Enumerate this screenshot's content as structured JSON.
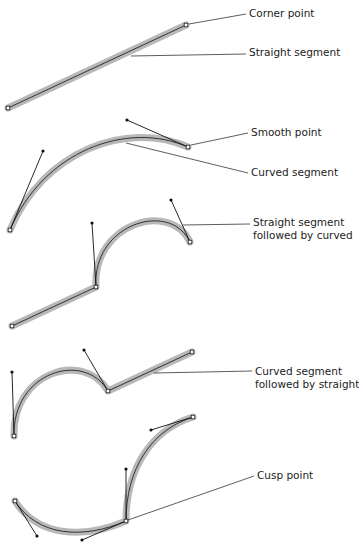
{
  "diagram": {
    "colors": {
      "halo": "#b8b8b8",
      "path": "#222222",
      "handle": "#111111",
      "leader": "#333333",
      "text": "#222222"
    },
    "labels": [
      {
        "id": "corner_point",
        "lines": [
          "Corner point"
        ],
        "x": 249,
        "y": 7
      },
      {
        "id": "straight_segment",
        "lines": [
          "Straight segment"
        ],
        "x": 249,
        "y": 46
      },
      {
        "id": "smooth_point",
        "lines": [
          "Smooth point"
        ],
        "x": 251,
        "y": 126
      },
      {
        "id": "curved_segment",
        "lines": [
          "Curved segment"
        ],
        "x": 251,
        "y": 166
      },
      {
        "id": "straight_then_curved",
        "lines": [
          "Straight segment",
          "followed by curved"
        ],
        "x": 253,
        "y": 216
      },
      {
        "id": "curved_then_straight",
        "lines": [
          "Curved segment",
          "followed by straight"
        ],
        "x": 255,
        "y": 365
      },
      {
        "id": "cusp_point",
        "lines": [
          "Cusp point"
        ],
        "x": 257,
        "y": 469
      }
    ],
    "shapes": [
      {
        "id": "straight_line",
        "path": "M8,108 L186,25",
        "anchors": [
          [
            8,
            108
          ],
          [
            186,
            25
          ]
        ],
        "handles": []
      },
      {
        "id": "smooth_curve",
        "path": "M10,230 C43,151 127,120 188,147",
        "anchors": [
          [
            10,
            230
          ],
          [
            188,
            147
          ]
        ],
        "handles": [
          [
            [
              10,
              230
            ],
            [
              43,
              151
            ]
          ],
          [
            [
              188,
              147
            ],
            [
              127,
              120
            ]
          ]
        ]
      },
      {
        "id": "straight_then_curve",
        "path": "M12,326 L96,287 C92,223 171,200 190,242",
        "anchors": [
          [
            12,
            326
          ],
          [
            96,
            287
          ],
          [
            190,
            242
          ]
        ],
        "handles": [
          [
            [
              96,
              287
            ],
            [
              92,
              223
            ]
          ],
          [
            [
              190,
              242
            ],
            [
              171,
              200
            ]
          ]
        ]
      },
      {
        "id": "curve_then_straight",
        "path": "M14,436 C12,372 84,350 108,391 L192,352",
        "anchors": [
          [
            14,
            436
          ],
          [
            108,
            391
          ],
          [
            192,
            352
          ]
        ],
        "handles": [
          [
            [
              14,
              436
            ],
            [
              12,
              372
            ]
          ],
          [
            [
              108,
              391
            ],
            [
              84,
              350
            ]
          ]
        ]
      },
      {
        "id": "cusp_shape",
        "path": "M15,501 C37,536 82,540 126,521 C126,469 151,430 193,417",
        "anchors": [
          [
            15,
            501
          ],
          [
            126,
            521
          ],
          [
            193,
            417
          ]
        ],
        "handles": [
          [
            [
              15,
              501
            ],
            [
              37,
              536
            ]
          ],
          [
            [
              126,
              521
            ],
            [
              82,
              540
            ]
          ],
          [
            [
              126,
              521
            ],
            [
              126,
              469
            ]
          ],
          [
            [
              193,
              417
            ],
            [
              151,
              430
            ]
          ]
        ]
      }
    ],
    "leaders": [
      {
        "for": "corner_point",
        "from": [
          189,
          24
        ],
        "to": [
          246,
          14
        ]
      },
      {
        "for": "straight_segment",
        "from": [
          131,
          56
        ],
        "to": [
          246,
          54
        ]
      },
      {
        "for": "smooth_point",
        "from": [
          191,
          145
        ],
        "to": [
          248,
          133
        ]
      },
      {
        "for": "curved_segment",
        "from": [
          126,
          143
        ],
        "to": [
          248,
          173
        ]
      },
      {
        "for": "straight_then_curved",
        "from": [
          183,
          225
        ],
        "to": [
          250,
          224
        ]
      },
      {
        "for": "curved_then_straight",
        "from": [
          154,
          373
        ],
        "to": [
          252,
          371
        ]
      },
      {
        "for": "cusp_point",
        "from": [
          128,
          520
        ],
        "to": [
          254,
          476
        ]
      }
    ]
  }
}
